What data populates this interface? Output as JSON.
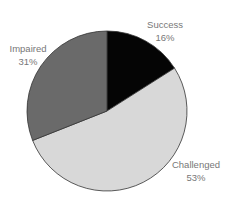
{
  "chart_data": {
    "type": "pie",
    "title": "",
    "categories": [
      "Success",
      "Challenged",
      "Impaired"
    ],
    "values": [
      16,
      53,
      31
    ],
    "colors": [
      "#050505",
      "#d8d8d8",
      "#6a6a6a"
    ],
    "start_angle_deg": 0,
    "direction": "clockwise",
    "labels": [
      {
        "name": "Success",
        "pct": "16%"
      },
      {
        "name": "Challenged",
        "pct": "53%"
      },
      {
        "name": "Impaired",
        "pct": "31%"
      }
    ]
  }
}
